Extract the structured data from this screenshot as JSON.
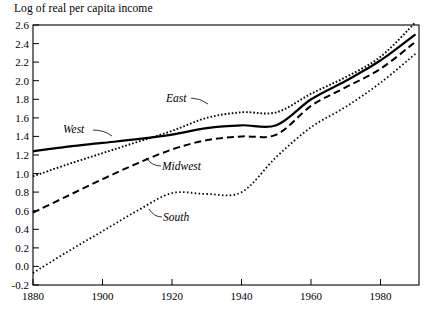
{
  "chart_data": {
    "type": "line",
    "title": "Log of real per capita income",
    "xlabel": "",
    "ylabel": "",
    "xlim": [
      1880,
      1991
    ],
    "ylim": [
      -0.2,
      2.6
    ],
    "xticks": [
      1880,
      1900,
      1920,
      1940,
      1960,
      1980
    ],
    "xtick_labels": [
      "1880",
      "1900",
      "1920",
      "1940",
      "1960",
      "1980"
    ],
    "yticks": [
      -0.2,
      0.0,
      0.2,
      0.4,
      0.6,
      0.8,
      1.0,
      1.2,
      1.4,
      1.6,
      1.8,
      2.0,
      2.2,
      2.4,
      2.6
    ],
    "ytick_labels": [
      "-0.2",
      "0.0",
      "0.2",
      "0.4",
      "0.6",
      "0.8",
      "1.0",
      "1.2",
      "1.4",
      "1.6",
      "1.8",
      "2.0",
      "2.2",
      "2.4",
      "2.6"
    ],
    "grid": false,
    "legend_position": "inline-annotations",
    "series": [
      {
        "name": "West",
        "style": "solid",
        "x": [
          1880,
          1890,
          1900,
          1910,
          1920,
          1930,
          1940,
          1950,
          1960,
          1970,
          1980,
          1990
        ],
        "values": [
          1.24,
          1.29,
          1.33,
          1.37,
          1.42,
          1.49,
          1.52,
          1.52,
          1.8,
          2.0,
          2.22,
          2.5
        ]
      },
      {
        "name": "East",
        "style": "dotted",
        "x": [
          1880,
          1890,
          1900,
          1910,
          1920,
          1930,
          1940,
          1950,
          1960,
          1970,
          1980,
          1990
        ],
        "values": [
          0.97,
          1.1,
          1.22,
          1.34,
          1.46,
          1.6,
          1.66,
          1.66,
          1.86,
          2.04,
          2.26,
          2.63
        ]
      },
      {
        "name": "Midwest",
        "style": "dashed",
        "x": [
          1880,
          1890,
          1900,
          1910,
          1920,
          1930,
          1940,
          1950,
          1960,
          1970,
          1980,
          1990
        ],
        "values": [
          0.58,
          0.76,
          0.94,
          1.11,
          1.26,
          1.36,
          1.4,
          1.42,
          1.73,
          1.93,
          2.13,
          2.42
        ]
      },
      {
        "name": "South",
        "style": "fine-dotted",
        "x": [
          1880,
          1890,
          1900,
          1910,
          1920,
          1930,
          1940,
          1950,
          1960,
          1970,
          1980,
          1990
        ],
        "values": [
          -0.07,
          0.16,
          0.38,
          0.6,
          0.79,
          0.78,
          0.8,
          1.18,
          1.5,
          1.72,
          1.98,
          2.29
        ]
      }
    ],
    "annotations": [
      {
        "label": "West",
        "x_px": 63,
        "y_px": 133
      },
      {
        "label": "East",
        "x_px": 166,
        "y_px": 102
      },
      {
        "label": "Midwest",
        "x_px": 162,
        "y_px": 170
      },
      {
        "label": "South",
        "x_px": 163,
        "y_px": 221
      }
    ]
  }
}
